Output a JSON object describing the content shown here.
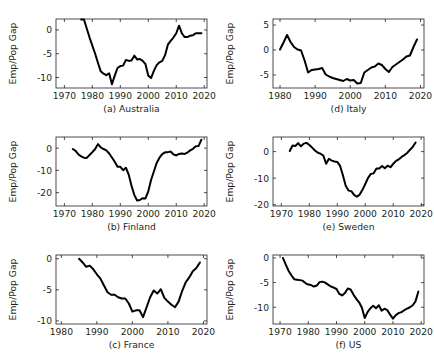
{
  "figure": {
    "title": "",
    "ylabel": "Emp/Pop Gap",
    "panel_order": [
      "a",
      "d",
      "b",
      "e",
      "c",
      "f"
    ],
    "line_color": "#000000",
    "axis_color": "#231f20",
    "background": "#ffffff"
  },
  "chart_data": [
    {
      "id": "a",
      "type": "line",
      "title": "(a) Australia",
      "xlabel": "",
      "ylabel": "Emp/Pop Gap",
      "xlim": [
        1967,
        2021
      ],
      "ylim": [
        -12.2,
        2.3
      ],
      "xticks": [
        1970,
        1980,
        1990,
        2000,
        2010,
        2020
      ],
      "xticklabels": [
        "1970",
        "1980",
        "1990",
        "2000",
        "2010",
        "2020"
      ],
      "yticks": [
        0,
        -5,
        -10
      ],
      "yticklabels": [
        "0",
        "-5",
        "-10"
      ],
      "grid": false,
      "legend": false,
      "x": [
        1976,
        1977,
        1978,
        1979,
        1980,
        1981,
        1982,
        1983,
        1984,
        1985,
        1986,
        1987,
        1988,
        1989,
        1990,
        1991,
        1992,
        1993,
        1994,
        1995,
        1996,
        1997,
        1998,
        1999,
        2000,
        2001,
        2002,
        2003,
        2004,
        2005,
        2006,
        2007,
        2008,
        2009,
        2010,
        2011,
        2012,
        2013,
        2014,
        2015,
        2016,
        2017,
        2018,
        2019
      ],
      "values": [
        2.2,
        2.2,
        0.3,
        -1.6,
        -3.3,
        -5.0,
        -6.9,
        -8.7,
        -9.2,
        -9.5,
        -9.1,
        -11.4,
        -9.6,
        -8.0,
        -7.6,
        -7.5,
        -6.3,
        -6.5,
        -6.4,
        -5.4,
        -6.2,
        -6.1,
        -6.5,
        -7.2,
        -9.6,
        -10.1,
        -8.6,
        -7.4,
        -6.8,
        -6.5,
        -5.3,
        -3.1,
        -2.3,
        -1.6,
        -0.7,
        0.9,
        -0.7,
        -1.5,
        -1.5,
        -1.2,
        -1.1,
        -0.7,
        -0.7,
        -0.7
      ]
    },
    {
      "id": "d",
      "type": "line",
      "title": "(d) Italy",
      "xlabel": "",
      "ylabel": "Emp/Pop Gap",
      "xlim": [
        1978,
        2021
      ],
      "ylim": [
        -7.6,
        6.2
      ],
      "xticks": [
        1980,
        1990,
        2000,
        2010,
        2020
      ],
      "xticklabels": [
        "1980",
        "1990",
        "2000",
        "2010",
        "2020"
      ],
      "yticks": [
        5,
        0,
        -5
      ],
      "yticklabels": [
        "5",
        "0",
        "-5"
      ],
      "grid": false,
      "legend": false,
      "x": [
        1980,
        1981,
        1982,
        1983,
        1984,
        1985,
        1986,
        1987,
        1988,
        1989,
        1990,
        1991,
        1992,
        1993,
        1994,
        1995,
        1996,
        1997,
        1998,
        1999,
        2000,
        2001,
        2002,
        2003,
        2004,
        2005,
        2006,
        2007,
        2008,
        2009,
        2010,
        2011,
        2012,
        2013,
        2014,
        2015,
        2016,
        2017,
        2018,
        2019
      ],
      "values": [
        0.1,
        1.5,
        3.0,
        1.6,
        0.6,
        0.1,
        -0.1,
        -2.1,
        -4.5,
        -4.0,
        -3.9,
        -3.8,
        -3.6,
        -4.9,
        -5.3,
        -5.6,
        -5.8,
        -6.0,
        -6.2,
        -5.8,
        -6.1,
        -6.0,
        -6.7,
        -6.6,
        -4.5,
        -4.0,
        -3.5,
        -3.3,
        -2.7,
        -3.0,
        -3.8,
        -4.4,
        -3.4,
        -2.9,
        -2.4,
        -1.9,
        -1.3,
        -1.1,
        0.6,
        2.1
      ]
    },
    {
      "id": "b",
      "type": "line",
      "title": "(b) Finland",
      "xlabel": "",
      "ylabel": "Emp/Pop Gap",
      "xlim": [
        1967,
        2021
      ],
      "ylim": [
        -26,
        5
      ],
      "xticks": [
        1970,
        1980,
        1990,
        2000,
        2010,
        2020
      ],
      "xticklabels": [
        "1970",
        "1980",
        "1990",
        "2000",
        "2010",
        "2020"
      ],
      "yticks": [
        0,
        -10,
        -20
      ],
      "yticklabels": [
        "0",
        "-10",
        "-20"
      ],
      "grid": false,
      "legend": false,
      "x": [
        1973,
        1974,
        1975,
        1976,
        1977,
        1978,
        1979,
        1980,
        1981,
        1982,
        1983,
        1984,
        1985,
        1986,
        1987,
        1988,
        1989,
        1990,
        1991,
        1992,
        1993,
        1994,
        1995,
        1996,
        1997,
        1998,
        1999,
        2000,
        2001,
        2002,
        2003,
        2004,
        2005,
        2006,
        2007,
        2008,
        2009,
        2010,
        2011,
        2012,
        2013,
        2014,
        2015,
        2016,
        2017,
        2018,
        2019
      ],
      "values": [
        -0.4,
        -1.2,
        -2.8,
        -3.7,
        -4.3,
        -4.4,
        -3.1,
        -1.8,
        -0.4,
        1.8,
        0.3,
        -0.4,
        -1.0,
        -2.4,
        -4.2,
        -6.1,
        -8.4,
        -8.4,
        -9.9,
        -8.8,
        -11.9,
        -16.9,
        -21.0,
        -23.5,
        -23.3,
        -22.5,
        -22.6,
        -19.4,
        -14.3,
        -10.5,
        -6.7,
        -4.3,
        -2.7,
        -1.9,
        -1.8,
        -1.5,
        -2.8,
        -3.3,
        -2.6,
        -2.4,
        -2.6,
        -2.0,
        -1.0,
        -0.3,
        0.8,
        1.0,
        3.8
      ]
    },
    {
      "id": "e",
      "type": "line",
      "title": "(e) Sweden",
      "xlabel": "",
      "ylabel": "Emp/Pop Gap",
      "xlim": [
        1967,
        2021
      ],
      "ylim": [
        -20.5,
        5.5
      ],
      "xticks": [
        1970,
        1980,
        1990,
        2000,
        2010,
        2020
      ],
      "xticklabels": [
        "1970",
        "1980",
        "1990",
        "2000",
        "2010",
        "2020"
      ],
      "yticks": [
        0,
        -10,
        -20
      ],
      "yticklabels": [
        "0",
        "-10",
        "-20"
      ],
      "grid": false,
      "legend": false,
      "x": [
        1973,
        1974,
        1975,
        1976,
        1977,
        1978,
        1979,
        1980,
        1981,
        1982,
        1983,
        1984,
        1985,
        1986,
        1987,
        1988,
        1989,
        1990,
        1991,
        1992,
        1993,
        1994,
        1995,
        1996,
        1997,
        1998,
        1999,
        2000,
        2001,
        2002,
        2003,
        2004,
        2005,
        2006,
        2007,
        2008,
        2009,
        2010,
        2011,
        2012,
        2013,
        2014,
        2015,
        2016,
        2017,
        2018
      ],
      "values": [
        0.2,
        2.3,
        2.1,
        3.2,
        2.0,
        3.0,
        3.3,
        2.5,
        1.5,
        0.4,
        -0.4,
        -0.8,
        -1.5,
        -4.6,
        -2.7,
        -3.4,
        -3.7,
        -3.9,
        -5.4,
        -8.9,
        -12.9,
        -14.7,
        -14.9,
        -16.3,
        -17.0,
        -16.2,
        -14.4,
        -12.2,
        -9.9,
        -8.4,
        -8.2,
        -6.4,
        -6.4,
        -5.4,
        -6.3,
        -5.3,
        -5.9,
        -4.6,
        -3.5,
        -2.9,
        -2.0,
        -1.3,
        -0.5,
        0.7,
        1.8,
        3.4
      ]
    },
    {
      "id": "c",
      "type": "line",
      "title": "(c) France",
      "xlabel": "",
      "ylabel": "Emp/Pop Gap",
      "xlim": [
        1978.5,
        2021
      ],
      "ylim": [
        -10.5,
        0.6
      ],
      "xticks": [
        1980,
        1990,
        2000,
        2010,
        2020
      ],
      "xticklabels": [
        "1980",
        "1990",
        "2000",
        "2010",
        "2020"
      ],
      "yticks": [
        0,
        -5,
        -10
      ],
      "yticklabels": [
        "0",
        "-5",
        "-10"
      ],
      "grid": false,
      "legend": false,
      "x": [
        1985,
        1986,
        1987,
        1988,
        1989,
        1990,
        1991,
        1992,
        1993,
        1994,
        1995,
        1996,
        1997,
        1998,
        1999,
        2000,
        2001,
        2002,
        2003,
        2004,
        2005,
        2006,
        2007,
        2008,
        2009,
        2010,
        2011,
        2012,
        2013,
        2014,
        2015,
        2016,
        2017,
        2018,
        2019
      ],
      "values": [
        0.0,
        -0.6,
        -1.3,
        -1.1,
        -1.7,
        -2.5,
        -3.2,
        -4.3,
        -5.4,
        -5.8,
        -5.8,
        -6.2,
        -6.4,
        -6.4,
        -7.2,
        -8.5,
        -8.3,
        -8.3,
        -9.4,
        -7.8,
        -6.2,
        -5.1,
        -5.6,
        -4.9,
        -6.3,
        -6.9,
        -7.4,
        -7.8,
        -6.9,
        -5.2,
        -3.8,
        -3.0,
        -2.0,
        -1.5,
        -0.6
      ]
    },
    {
      "id": "f",
      "type": "line",
      "title": "(f) US",
      "xlabel": "",
      "ylabel": "Emp/Pop Gap",
      "xlim": [
        1967.5,
        2021
      ],
      "ylim": [
        -13.4,
        0.6
      ],
      "xticks": [
        1970,
        1980,
        1990,
        2000,
        2010,
        2020
      ],
      "xticklabels": [
        "1970",
        "1980",
        "1990",
        "2000",
        "2010",
        "2020"
      ],
      "yticks": [
        0,
        -5,
        -10
      ],
      "yticklabels": [
        "0",
        "-5",
        "-10"
      ],
      "grid": false,
      "legend": false,
      "x": [
        1971,
        1972,
        1973,
        1974,
        1975,
        1976,
        1977,
        1978,
        1979,
        1980,
        1981,
        1982,
        1983,
        1984,
        1985,
        1986,
        1987,
        1988,
        1989,
        1990,
        1991,
        1992,
        1993,
        1994,
        1995,
        1996,
        1997,
        1998,
        1999,
        2000,
        2001,
        2002,
        2003,
        2004,
        2005,
        2006,
        2007,
        2008,
        2009,
        2010,
        2011,
        2012,
        2013,
        2014,
        2015,
        2016,
        2017,
        2018,
        2019
      ],
      "values": [
        0.0,
        -1.3,
        -2.6,
        -3.5,
        -4.3,
        -4.4,
        -4.5,
        -4.6,
        -5.1,
        -5.4,
        -5.5,
        -5.8,
        -5.6,
        -4.9,
        -4.8,
        -5.0,
        -5.4,
        -5.8,
        -6.0,
        -6.3,
        -7.3,
        -7.6,
        -7.1,
        -6.2,
        -6.4,
        -7.4,
        -8.3,
        -9.0,
        -10.1,
        -12.2,
        -11.0,
        -10.2,
        -9.7,
        -10.2,
        -9.6,
        -10.7,
        -10.3,
        -10.6,
        -11.5,
        -12.3,
        -11.6,
        -11.2,
        -11.0,
        -10.6,
        -10.3,
        -10.0,
        -9.6,
        -8.8,
        -6.8
      ]
    }
  ],
  "footer": {
    "note": ""
  }
}
